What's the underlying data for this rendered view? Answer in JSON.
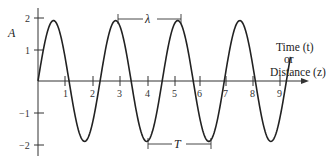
{
  "chart_data": {
    "type": "line",
    "title": "",
    "xlabel": "Time (t) or Distance (z)",
    "xlabel_lines": [
      "Time (t)",
      "or",
      "Distance (z)"
    ],
    "ylabel": "A",
    "xlim": [
      0,
      9.6
    ],
    "ylim": [
      -2,
      2
    ],
    "x_ticks": [
      1,
      2,
      3,
      4,
      5,
      6,
      7,
      8,
      9
    ],
    "y_ticks": [
      2,
      1,
      -1,
      -2
    ],
    "grid": false,
    "legend": null,
    "series": [
      {
        "name": "sine wave",
        "function": "A = 1.9 * sin(2*pi*x / 2.3)",
        "amplitude": 1.9,
        "period": 2.3,
        "x_start": 0,
        "x_end": 9.35
      }
    ],
    "annotations": [
      {
        "label": "λ",
        "from_x": 2.9,
        "to_x": 5.2,
        "y": 1.9,
        "meaning": "wavelength (peak to peak)"
      },
      {
        "label": "T",
        "from_x": 4.05,
        "to_x": 6.35,
        "y": -1.9,
        "meaning": "period (trough to trough)"
      }
    ]
  },
  "labels": {
    "y_axis": "A",
    "x_axis_line1": "Time (t)",
    "x_axis_line2": "or",
    "x_axis_line3": "Distance (z)",
    "lambda": "λ",
    "period": "T",
    "x_ticks": [
      "1",
      "2",
      "3",
      "4",
      "5",
      "6",
      "7",
      "8",
      "9"
    ],
    "y_ticks": [
      "2",
      "1",
      "−1",
      "−2"
    ]
  }
}
